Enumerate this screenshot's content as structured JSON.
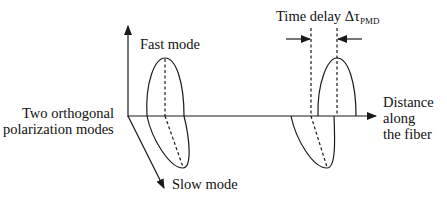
{
  "diagram": {
    "labels": {
      "time_delay": "Time delay Δτ",
      "time_delay_sub": "PMD",
      "fast_mode": "Fast mode",
      "slow_mode": "Slow mode",
      "two_modes_line1": "Two orthogonal",
      "two_modes_line2": "polarization modes",
      "distance_line1": "Distance",
      "distance_line2": "along",
      "distance_line3": "the fiber"
    },
    "axes": [
      "fast-mode axis (vertical)",
      "slow-mode axis (diagonal)",
      "distance along fiber (horizontal)"
    ],
    "pulses": [
      {
        "position": "input",
        "fast_and_slow_aligned": true
      },
      {
        "position": "output",
        "fast_and_slow_separated_by": "Δτ_PMD"
      }
    ],
    "colors": {
      "line": "#1a1a1a",
      "background": "#ffffff"
    }
  }
}
